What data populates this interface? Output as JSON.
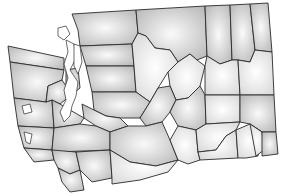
{
  "map": {
    "title": "Washington State Counties",
    "background": "#ffffff",
    "stroke_color": "#2a2a2a",
    "fill_light": "#f4f4f4",
    "fill_dark": "#bdbdbd",
    "labels_visible": false,
    "counties": [
      {
        "name": "Whatcom",
        "points": "72,14 136,10 138,33 132,44 80,46 78,30"
      },
      {
        "name": "Okanogan",
        "points": "136,10 205,6 207,56 197,60 190,54 178,62 170,50 155,48 146,36 138,33"
      },
      {
        "name": "Ferry",
        "points": "205,6 230,5 232,60 220,64 207,56"
      },
      {
        "name": "Stevens",
        "points": "230,5 250,4 255,50 250,62 238,60 232,60"
      },
      {
        "name": "Pend Oreille",
        "points": "250,4 268,3 272,52 255,50"
      },
      {
        "name": "Skagit",
        "points": "80,46 132,44 134,66 86,66"
      },
      {
        "name": "Snohomish",
        "points": "86,66 134,66 136,92 92,92"
      },
      {
        "name": "Chelan",
        "points": "132,44 138,33 146,36 155,48 170,50 178,62 168,72 158,88 150,102 136,92 134,66"
      },
      {
        "name": "Douglas",
        "points": "168,72 178,62 190,54 197,60 205,66 200,86 188,98 176,100 170,86"
      },
      {
        "name": "Lincoln",
        "points": "207,56 220,64 232,60 238,60 240,95 205,95 205,66"
      },
      {
        "name": "Spokane",
        "points": "238,60 250,62 255,50 272,52 274,95 240,95"
      },
      {
        "name": "Clallam",
        "points": "8,46 64,58 64,70 10,62"
      },
      {
        "name": "Jefferson",
        "points": "10,62 64,70 62,80 48,86 46,102 14,98"
      },
      {
        "name": "Kitsap",
        "points": "66,70 78,68 80,88 70,96 66,86"
      },
      {
        "name": "King",
        "points": "92,92 136,92 150,102 140,118 120,118 106,116 94,110"
      },
      {
        "name": "Grays Harbor",
        "points": "14,98 46,102 52,100 54,128 18,126"
      },
      {
        "name": "Mason",
        "points": "48,86 62,80 66,86 70,96 60,104 52,100 46,102"
      },
      {
        "name": "Pierce",
        "points": "82,104 94,110 106,116 120,118 128,126 110,132 96,126 84,118"
      },
      {
        "name": "Thurston",
        "points": "52,100 60,104 70,110 84,118 80,124 54,128"
      },
      {
        "name": "Kittitas",
        "points": "140,118 150,102 158,88 170,86 176,100 170,112 162,122 146,126"
      },
      {
        "name": "Grant",
        "points": "176,100 188,98 200,86 205,95 206,124 196,130 178,126 170,112"
      },
      {
        "name": "Adams",
        "points": "205,95 240,95 240,122 206,124"
      },
      {
        "name": "Whitman",
        "points": "240,95 274,95 276,132 262,132 250,124 240,122"
      },
      {
        "name": "Pacific",
        "points": "18,126 54,128 52,150 24,148"
      },
      {
        "name": "Lewis",
        "points": "54,128 80,124 96,126 110,132 110,150 56,152 52,150"
      },
      {
        "name": "Yakima",
        "points": "110,132 128,126 146,126 162,122 170,140 178,160 156,166 130,162 110,150"
      },
      {
        "name": "Benton",
        "points": "170,140 178,126 196,130 198,152 200,160 188,164 178,160"
      },
      {
        "name": "Franklin",
        "points": "196,130 206,124 240,122 236,130 226,136 216,150 198,152"
      },
      {
        "name": "Walla Walla",
        "points": "198,152 216,150 226,136 236,130 238,158 200,160"
      },
      {
        "name": "Columbia",
        "points": "236,130 250,124 262,132 258,156 246,158 238,158"
      },
      {
        "name": "Garfield",
        "points": "250,124 262,132 264,150 256,156"
      },
      {
        "name": "Asotin",
        "points": "262,132 276,132 278,154 262,156"
      },
      {
        "name": "Wahkiakum",
        "points": "24,148 52,150 54,160 34,162"
      },
      {
        "name": "Cowlitz",
        "points": "52,150 76,152 80,170 70,174 58,168 54,160"
      },
      {
        "name": "Skamania",
        "points": "76,152 110,150 112,178 92,182 80,170"
      },
      {
        "name": "Clark",
        "points": "58,168 70,174 80,170 84,190 70,192 62,182"
      },
      {
        "name": "Klickitat",
        "points": "110,150 130,162 156,166 178,160 168,172 140,180 112,184 112,178"
      }
    ],
    "water_bodies": [
      {
        "name": "Puget Sound",
        "points": "66,40 74,44 76,58 70,70 78,82 76,96 72,106 70,116 64,122 60,112 66,100 64,90 68,78 64,64 68,52"
      },
      {
        "name": "San Juan Islands",
        "points": "58,28 66,26 70,34 64,40 58,36"
      },
      {
        "name": "Whidbey Island",
        "points": "74,44 80,46 82,62 78,74 74,66"
      },
      {
        "name": "Grays Harbor Bay",
        "points": "22,106 30,104 32,112 24,114"
      },
      {
        "name": "Willapa Bay",
        "points": "24,132 32,134 30,144 26,142"
      }
    ]
  }
}
